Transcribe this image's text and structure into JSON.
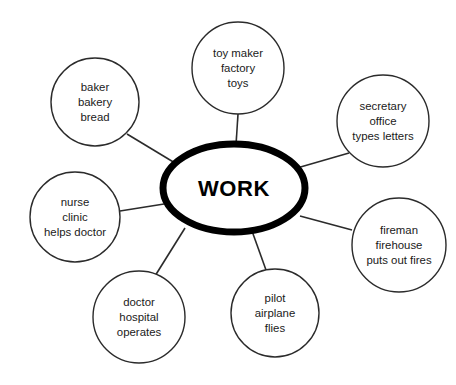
{
  "diagram": {
    "type": "word-web",
    "title": "WORK",
    "center": {
      "label": "WORK",
      "cx": 234,
      "cy": 188,
      "rx": 71,
      "ry": 44,
      "stroke_color": "#000000",
      "fill_color": "#ffffff",
      "stroke_width": 7
    },
    "style": {
      "background_color": "#ffffff",
      "satellite_stroke_color": "#2b2b2b",
      "satellite_fill_color": "#ffffff",
      "text_color": "#1a1a1a",
      "connector_color": "#2b2b2b"
    },
    "nodes": [
      {
        "id": "toy-maker",
        "lines": [
          "toy maker",
          "factory",
          "toys"
        ],
        "cx": 238,
        "cy": 68,
        "r": 46,
        "connector": {
          "x1": 238,
          "y1": 114,
          "x2": 236,
          "y2": 145
        }
      },
      {
        "id": "secretary",
        "lines": [
          "secretary",
          "office",
          "types letters"
        ],
        "cx": 383,
        "cy": 121,
        "r": 46,
        "connector": {
          "x1": 349,
          "y1": 153,
          "x2": 297,
          "y2": 168
        }
      },
      {
        "id": "fireman",
        "lines": [
          "fireman",
          "firehouse",
          "puts out fires"
        ],
        "cx": 399,
        "cy": 245,
        "r": 47,
        "connector": {
          "x1": 352,
          "y1": 230,
          "x2": 300,
          "y2": 216
        }
      },
      {
        "id": "pilot",
        "lines": [
          "pilot",
          "airplane",
          "flies"
        ],
        "cx": 275,
        "cy": 313,
        "r": 44,
        "connector": {
          "x1": 266,
          "y1": 270,
          "x2": 252,
          "y2": 231
        }
      },
      {
        "id": "doctor",
        "lines": [
          "doctor",
          "hospital",
          "operates"
        ],
        "cx": 139,
        "cy": 317,
        "r": 46,
        "connector": {
          "x1": 155,
          "y1": 276,
          "x2": 185,
          "y2": 228
        }
      },
      {
        "id": "nurse",
        "lines": [
          "nurse",
          "clinic",
          "helps doctor"
        ],
        "cx": 75,
        "cy": 217,
        "r": 45,
        "connector": {
          "x1": 120,
          "y1": 211,
          "x2": 164,
          "y2": 204
        }
      },
      {
        "id": "baker",
        "lines": [
          "baker",
          "bakery",
          "bread"
        ],
        "cx": 95,
        "cy": 102,
        "r": 44,
        "connector": {
          "x1": 127,
          "y1": 134,
          "x2": 175,
          "y2": 163
        }
      }
    ]
  }
}
